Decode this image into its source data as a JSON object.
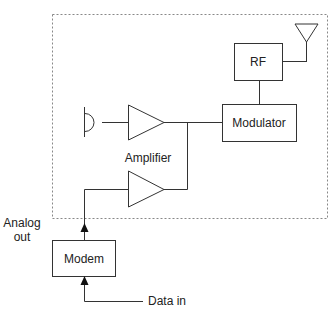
{
  "diagram": {
    "type": "block-diagram",
    "colors": {
      "stroke": "#333333",
      "boundary": "#888888",
      "background": "#ffffff"
    },
    "labels": {
      "rf": "RF",
      "modulator": "Modulator",
      "amplifier": "Amplifier",
      "modem": "Modem",
      "analog_out_line1": "Analog",
      "analog_out_line2": "out",
      "data_in": "Data in"
    },
    "blocks": [
      {
        "id": "rf",
        "label": "RF",
        "shape": "rect"
      },
      {
        "id": "modulator",
        "label": "Modulator",
        "shape": "rect"
      },
      {
        "id": "amp-top",
        "label": "",
        "shape": "triangle"
      },
      {
        "id": "amp-bottom",
        "label": "",
        "shape": "triangle"
      },
      {
        "id": "modem",
        "label": "Modem",
        "shape": "rect"
      },
      {
        "id": "microphone",
        "label": "",
        "shape": "mic-symbol"
      },
      {
        "id": "antenna",
        "label": "",
        "shape": "antenna-symbol"
      }
    ],
    "connections": [
      {
        "from": "microphone",
        "to": "amp-top"
      },
      {
        "from": "amp-top",
        "to": "modulator"
      },
      {
        "from": "amp-bottom",
        "to": "modulator"
      },
      {
        "from": "modulator",
        "to": "rf"
      },
      {
        "from": "rf",
        "to": "antenna"
      },
      {
        "from": "modem",
        "to": "amp-bottom",
        "label": "Analog out",
        "arrow": true
      },
      {
        "from": "data-in",
        "to": "modem",
        "label": "Data in",
        "arrow": true
      }
    ]
  }
}
